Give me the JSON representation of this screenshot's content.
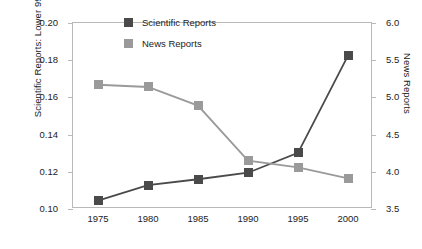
{
  "chart_data": {
    "type": "line",
    "title": "",
    "xlabel": "",
    "categories": [
      1975,
      1980,
      1985,
      1990,
      1995,
      2000
    ],
    "xticklabels": [
      "1975",
      "1980",
      "1985",
      "1990",
      "1995",
      "2000"
    ],
    "grid": false,
    "legend_position": "top-center",
    "axes": {
      "left": {
        "label": "Scientific Reports: Lower 99.9% C.I.",
        "ylim": [
          0.1,
          0.2
        ],
        "ticks": [
          0.1,
          0.12,
          0.14,
          0.16,
          0.18,
          0.2
        ],
        "ticklabels": [
          "0.10",
          "0.12",
          "0.14",
          "0.16",
          "0.18",
          "0.20"
        ]
      },
      "right": {
        "label": "News Reports",
        "ylim": [
          3.5,
          6.0
        ],
        "ticks": [
          3.5,
          4.0,
          4.5,
          5.0,
          5.5,
          6.0
        ],
        "ticklabels": [
          "3.5",
          "4.0",
          "4.5",
          "5.0",
          "5.5",
          "6.0"
        ]
      }
    },
    "series": [
      {
        "name": "Scientific Reports",
        "axis": "left",
        "color": "#4a4a4a",
        "marker": "square",
        "values": [
          0.1045,
          0.1128,
          0.116,
          0.1195,
          0.1302,
          0.1825
        ]
      },
      {
        "name": "News Reports",
        "axis": "right",
        "color": "#9a9a9a",
        "marker": "square",
        "values": [
          5.17,
          5.14,
          4.89,
          4.15,
          4.06,
          3.91
        ]
      }
    ]
  },
  "legend": {
    "items": [
      {
        "label": "Scientific Reports",
        "color": "#4a4a4a"
      },
      {
        "label": "News Reports",
        "color": "#9a9a9a"
      }
    ]
  }
}
